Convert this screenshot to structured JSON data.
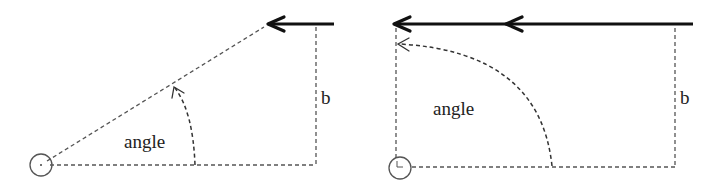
{
  "diagrams": [
    {
      "id": "left",
      "description": "Force applied at an angle less than 90 degrees",
      "labels": {
        "angle": "angle",
        "lever": "b"
      },
      "pivot": {
        "cx": 41,
        "cy": 165,
        "r": 11
      },
      "colors": {
        "line": "#555555",
        "force": "#111111",
        "text": "#222222"
      }
    },
    {
      "id": "right",
      "description": "Force applied at a 90 degree angle",
      "labels": {
        "angle": "angle",
        "lever": "b"
      },
      "pivot": {
        "cx": 400,
        "cy": 168,
        "r": 11
      },
      "colors": {
        "line": "#555555",
        "force": "#111111",
        "text": "#222222"
      }
    }
  ]
}
